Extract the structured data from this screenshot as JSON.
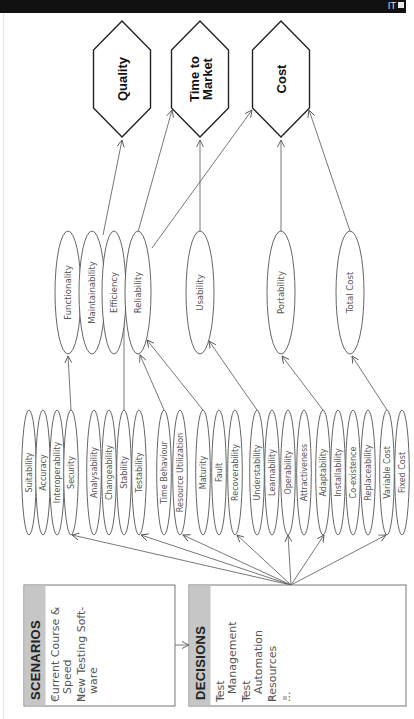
{
  "topbar": {
    "label": "IT"
  },
  "goals": [
    {
      "id": "quality",
      "lines": [
        "Quality"
      ],
      "cx": 122
    },
    {
      "id": "time-to-market",
      "lines": [
        "Time to",
        "Market"
      ],
      "cx": 200
    },
    {
      "id": "cost",
      "lines": [
        "Cost"
      ],
      "cx": 281
    }
  ],
  "characteristics": [
    {
      "id": "functionality",
      "label": "Functionality",
      "cx": 68,
      "rx": 13
    },
    {
      "id": "maintainability",
      "label": "Maintainability",
      "cx": 92,
      "rx": 13
    },
    {
      "id": "efficiency",
      "label": "Efficiency",
      "cx": 114,
      "rx": 12
    },
    {
      "id": "reliability",
      "label": "Reliability",
      "cx": 138,
      "rx": 13
    },
    {
      "id": "usability",
      "label": "Usability",
      "cx": 200,
      "rx": 14
    },
    {
      "id": "portability",
      "label": "Portability",
      "cx": 281,
      "rx": 14
    },
    {
      "id": "total-cost",
      "label": "Total Cost",
      "cx": 350,
      "rx": 14
    }
  ],
  "subcharacteristics": [
    {
      "label": "Suitability",
      "cx": 29
    },
    {
      "label": "Accuracy",
      "cx": 43
    },
    {
      "label": "Interoperability",
      "cx": 57
    },
    {
      "label": "Security",
      "cx": 71
    },
    {
      "label": "Analysability",
      "cx": 94
    },
    {
      "label": "Changeability",
      "cx": 109
    },
    {
      "label": "Stability",
      "cx": 124
    },
    {
      "label": "Testability",
      "cx": 139
    },
    {
      "label": "Time Behaviour",
      "cx": 164
    },
    {
      "label": "Resource Utilization",
      "cx": 180
    },
    {
      "label": "Maturity",
      "cx": 203
    },
    {
      "label": "Fault",
      "cx": 219
    },
    {
      "label": "Recoverability",
      "cx": 235
    },
    {
      "label": "Understability",
      "cx": 257
    },
    {
      "label": "Learnability",
      "cx": 272
    },
    {
      "label": "Operability",
      "cx": 288
    },
    {
      "label": "Attractiveness",
      "cx": 304
    },
    {
      "label": "Adaptability",
      "cx": 323
    },
    {
      "label": "Installability",
      "cx": 338
    },
    {
      "label": "Co-existence",
      "cx": 353
    },
    {
      "label": "Replaceability",
      "cx": 368
    },
    {
      "label": "Variable Cost",
      "cx": 387
    },
    {
      "label": "Fixed Cost",
      "cx": 402
    }
  ],
  "scenarios": {
    "title": "SCENARIOS",
    "items": [
      {
        "lines": [
          "Current Course &",
          "Speed"
        ]
      },
      {
        "lines": [
          "New Testing Soft-",
          "ware"
        ]
      }
    ]
  },
  "decisions": {
    "title": "DECISIONS",
    "items": [
      {
        "lines": [
          "Test",
          "Management"
        ]
      },
      {
        "lines": [
          "Test",
          "Automation"
        ]
      },
      {
        "lines": [
          "Resources"
        ]
      },
      {
        "lines": [
          "..."
        ]
      }
    ]
  },
  "colors": {
    "header_gray": "#c6c6c6",
    "line": "#555555",
    "hex_stroke": "#222222",
    "topbar": "#111111"
  }
}
